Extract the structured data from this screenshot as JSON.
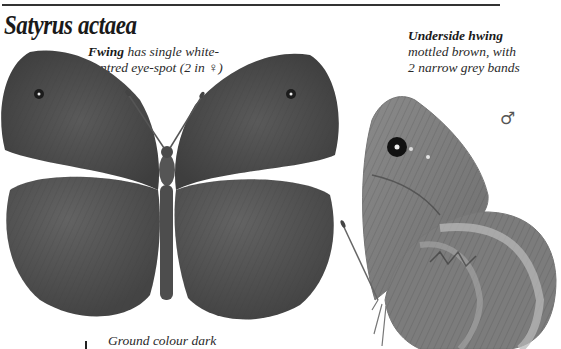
{
  "page": {
    "title": "Satyrus actaea",
    "captions": {
      "forewing": {
        "bold": "Fwing",
        "line1_rest": " has single white-",
        "line2": "centred eye-spot (2 in ♀)"
      },
      "underside": {
        "bold": "Underside hwing",
        "line2": "mottled brown, with",
        "line3": "2 narrow grey bands"
      },
      "ground": "Ground colour dark"
    },
    "symbols": {
      "male": "♂"
    },
    "illustrations": [
      {
        "name": "upperside-butterfly",
        "view": "upperside, wings open"
      },
      {
        "name": "underside-butterfly",
        "view": "underside, wings closed",
        "sex": "male"
      }
    ],
    "colors": {
      "wing_dark": "#4a4a4a",
      "wing_mid": "#5e5e5e",
      "underside_light": "#8c8c8c",
      "underside_band": "#b5b5b5",
      "rule": "#333333"
    }
  }
}
